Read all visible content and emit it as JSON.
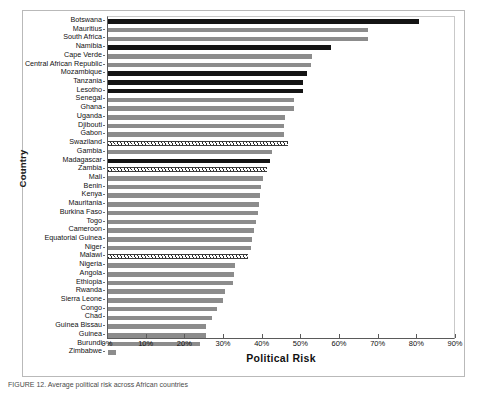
{
  "figure": {
    "caption": "FIGURE 12. Average political risk across African countries"
  },
  "axes": {
    "ylabel": "Country",
    "xlabel": "Political Risk",
    "xticks": [
      "0%",
      "10%",
      "20%",
      "30%",
      "40%",
      "50%",
      "60%",
      "70%",
      "80%",
      "90%"
    ]
  },
  "colors": {
    "bar_gray": "#8c8c8c",
    "bar_dark": "#141414",
    "hatch_line": "#2b2b2b",
    "frame": "#b9b9b9",
    "axis": "#5a5a5a"
  },
  "chart_data": {
    "type": "bar",
    "orientation": "horizontal",
    "title": "",
    "xlabel": "Political Risk",
    "ylabel": "Country",
    "xlim": [
      0,
      90
    ],
    "xtick_values": [
      0,
      10,
      20,
      30,
      40,
      50,
      60,
      70,
      80,
      90
    ],
    "xtick_labels": [
      "0%",
      "10%",
      "20%",
      "30%",
      "40%",
      "50%",
      "60%",
      "70%",
      "80%",
      "90%"
    ],
    "grid": false,
    "legend": null,
    "units": "percent",
    "categories": [
      "Botswana",
      "Mauritius",
      "South Africa",
      "Namibia",
      "Cape Verde",
      "Central African Republic",
      "Mozambique",
      "Tanzania",
      "Lesotho",
      "Senegal",
      "Ghana",
      "Uganda",
      "Djibouti",
      "Gabon",
      "Swaziland",
      "Gambia",
      "Madagascar",
      "Zambia",
      "Mali",
      "Benin",
      "Kenya",
      "Mauritania",
      "Burkina Faso",
      "Togo",
      "Cameroon",
      "Equatorial Guinea",
      "Niger",
      "Malawi",
      "Nigeria",
      "Angola",
      "Ethiopia",
      "Rwanda",
      "Sierra Leone",
      "Congo",
      "Chad",
      "Guinea Bissau",
      "Guinea",
      "Burundi",
      "Zimbabwe"
    ],
    "values": [
      80.9,
      67.7,
      67.6,
      57.9,
      53.0,
      52.9,
      51.7,
      50.7,
      50.6,
      48.5,
      48.3,
      46.0,
      45.9,
      45.7,
      46.8,
      42.6,
      42.1,
      41.4,
      40.3,
      39.9,
      39.6,
      39.2,
      38.9,
      38.5,
      37.9,
      37.4,
      37.2,
      36.5,
      33.1,
      32.8,
      32.5,
      30.5,
      30.0,
      28.4,
      27.0,
      25.5,
      25.4,
      23.9,
      2.0
    ],
    "styles": [
      "dark",
      "gray",
      "gray",
      "dark",
      "gray",
      "gray",
      "dark",
      "dark",
      "dark",
      "gray",
      "gray",
      "gray",
      "gray",
      "gray",
      "hatch",
      "gray",
      "dark",
      "hatch",
      "gray",
      "gray",
      "gray",
      "gray",
      "gray",
      "gray",
      "gray",
      "gray",
      "gray",
      "hatch",
      "gray",
      "gray",
      "gray",
      "gray",
      "gray",
      "gray",
      "gray",
      "gray",
      "gray",
      "gray",
      "gray"
    ]
  }
}
